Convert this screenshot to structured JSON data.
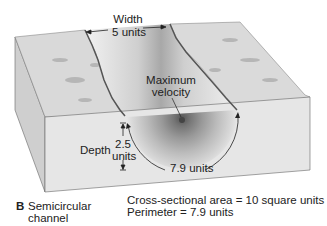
{
  "diagram": {
    "panel_letter": "B",
    "panel_title_line1": "Semicircular",
    "panel_title_line2": "channel",
    "width_label": "Width",
    "width_value": "5 units",
    "max_velocity_line1": "Maximum",
    "max_velocity_line2": "velocity",
    "depth_label": "Depth",
    "depth_value": "2.5",
    "depth_unit": "units",
    "perimeter_arc_label": "7.9 units",
    "area_text": "Cross-sectional area = 10 square units",
    "perimeter_text": "Perimeter = 7.9 units"
  },
  "colors": {
    "block_top": "#dcdcdc",
    "block_front": "#e6e6e6",
    "block_side": "#cfcfcf",
    "channel_light": "#efefef",
    "channel_dark": "#7a7a7a",
    "text": "#222222"
  }
}
